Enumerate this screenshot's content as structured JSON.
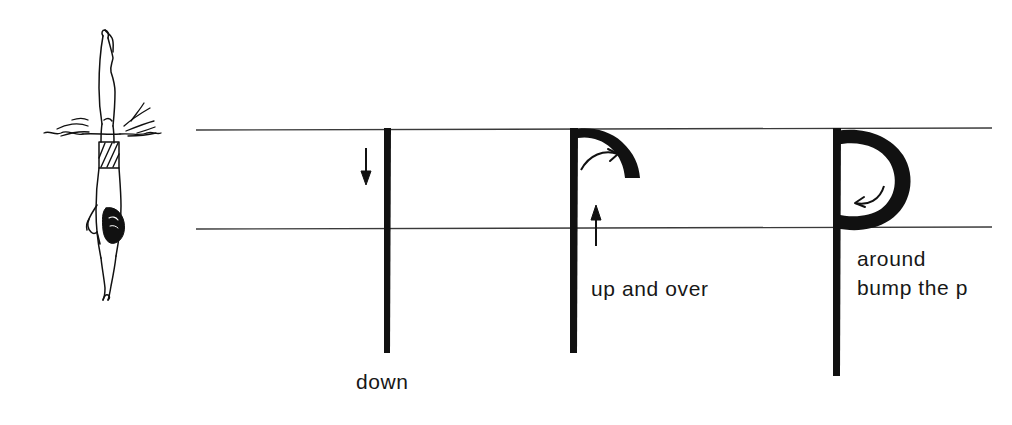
{
  "page": {
    "background_color": "#ffffff",
    "ink_color": "#111111",
    "rule_color": "#444444"
  },
  "illustration": {
    "name": "diver-entering-water",
    "description": "Line drawing of a diver entering the water head first, legs straight up, with splash marks at the waterline and a hatched swimsuit",
    "caption": ""
  },
  "guidelines": {
    "top_line_label": "top line",
    "baseline_label": "baseline",
    "x_start": 196,
    "x_end": 992,
    "top_y": 130,
    "baseline_y": 228
  },
  "strokes": [
    {
      "name": "stroke-1-down",
      "letter_part": "stem",
      "label": "down",
      "arrow": "down-arrow",
      "arrow_direction": "down"
    },
    {
      "name": "stroke-2-up-and-over",
      "letter_part": "stem-with-arc",
      "label": "up and over",
      "arrow": "up-arrow",
      "arrow_direction": "up",
      "secondary_arrow": "curve-right-arrow"
    },
    {
      "name": "stroke-3-around",
      "letter_part": "bowl",
      "label_line_1": "around",
      "label_line_2": "bump the p",
      "arrow": "curve-left-arrow",
      "arrow_direction": "left"
    }
  ],
  "letter": {
    "character": "p",
    "case": "lowercase"
  }
}
